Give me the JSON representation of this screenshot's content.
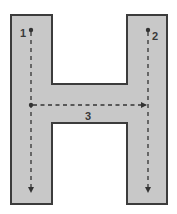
{
  "diagram": {
    "letter": "H",
    "colors": {
      "fill": "#c8c8c8",
      "outline": "#3c3c3c",
      "stroke_guide": "#333333",
      "background": "#ffffff"
    },
    "strokes": [
      {
        "number": "1",
        "direction": "down",
        "description": "left vertical stroke"
      },
      {
        "number": "2",
        "direction": "down",
        "description": "right vertical stroke"
      },
      {
        "number": "3",
        "direction": "right",
        "description": "horizontal crossbar stroke"
      }
    ]
  }
}
